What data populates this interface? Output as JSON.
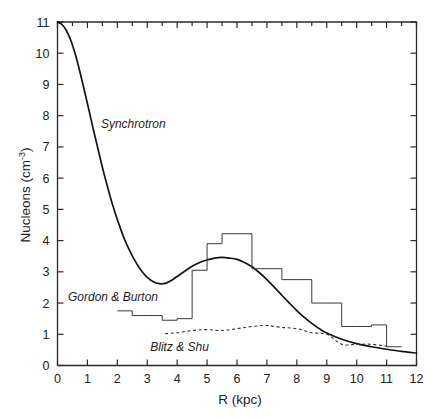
{
  "figure": {
    "background_color": "#ffffff",
    "ink_color": "#1a1a1a"
  },
  "chart_data": {
    "type": "line",
    "title": "",
    "subtitle": "",
    "xlabel": "R (kpc)",
    "ylabel": "Nucleons (cm",
    "ylabel_exponent": "-3",
    "ylabel_close": ")",
    "xlim": [
      0,
      12
    ],
    "ylim": [
      0,
      11
    ],
    "xticks": [
      0,
      1,
      2,
      3,
      4,
      5,
      6,
      7,
      8,
      9,
      10,
      11,
      12
    ],
    "xtick_labels": [
      "0",
      "1",
      "2",
      "3",
      "4",
      "5",
      "6",
      "7",
      "8",
      "9",
      "10",
      "11",
      "12"
    ],
    "yticks": [
      0,
      1,
      2,
      3,
      4,
      5,
      6,
      7,
      8,
      9,
      10,
      11
    ],
    "ytick_labels": [
      "0",
      "1",
      "2",
      "3",
      "4",
      "5",
      "6",
      "7",
      "8",
      "9",
      "10",
      "11"
    ],
    "grid": false,
    "legend": "inline-annotations",
    "frame": "box-with-inward-ticks",
    "annotations": [
      {
        "name": "synchrotron-label",
        "text": "Synchrotron",
        "x": 1.45,
        "y": 7.6,
        "style": "italic"
      },
      {
        "name": "gordon-burton-label",
        "text": "Gordon & Burton",
        "x": 0.35,
        "y": 2.05,
        "style": "italic"
      },
      {
        "name": "blitz-shu-label",
        "text": "Blitz & Shu",
        "x": 3.1,
        "y": 0.45,
        "style": "italic"
      }
    ],
    "series": [
      {
        "name": "Synchrotron",
        "style": "solid",
        "x": [
          0.0,
          0.15,
          0.3,
          0.45,
          0.6,
          0.75,
          0.9,
          1.05,
          1.2,
          1.35,
          1.5,
          1.65,
          1.8,
          1.95,
          2.1,
          2.25,
          2.4,
          2.55,
          2.7,
          2.85,
          3.0,
          3.2,
          3.4,
          3.6,
          3.8,
          4.0,
          4.25,
          4.5,
          4.75,
          5.0,
          5.25,
          5.5,
          5.75,
          6.0,
          6.25,
          6.5,
          6.75,
          7.0,
          7.25,
          7.5,
          7.75,
          8.0,
          8.25,
          8.5,
          8.75,
          9.0,
          9.5,
          10.0,
          10.5,
          11.0,
          11.5,
          12.0
        ],
        "y": [
          11.0,
          10.92,
          10.72,
          10.4,
          9.95,
          9.4,
          8.8,
          8.18,
          7.55,
          6.95,
          6.35,
          5.8,
          5.28,
          4.82,
          4.4,
          4.02,
          3.7,
          3.42,
          3.18,
          2.98,
          2.82,
          2.68,
          2.62,
          2.63,
          2.72,
          2.85,
          3.02,
          3.18,
          3.3,
          3.38,
          3.44,
          3.46,
          3.44,
          3.4,
          3.3,
          3.16,
          2.97,
          2.75,
          2.5,
          2.25,
          2.0,
          1.76,
          1.54,
          1.35,
          1.18,
          1.04,
          0.84,
          0.7,
          0.6,
          0.52,
          0.45,
          0.4
        ]
      },
      {
        "name": "Gordon & Burton",
        "style": "histogram-step",
        "bin_edges": [
          2.0,
          2.5,
          3.0,
          3.5,
          4.0,
          4.5,
          5.0,
          5.5,
          6.0,
          6.5,
          7.0,
          7.5,
          8.0,
          8.5,
          9.0,
          9.5,
          10.0,
          10.5,
          11.0
        ],
        "values": [
          1.75,
          1.6,
          1.6,
          1.45,
          1.5,
          3.05,
          3.9,
          4.22,
          4.22,
          3.1,
          3.1,
          2.75,
          2.75,
          2.0,
          2.0,
          1.25,
          1.25,
          1.3,
          0.6
        ]
      },
      {
        "name": "Blitz & Shu",
        "style": "dotted",
        "x": [
          3.6,
          4.0,
          4.5,
          5.0,
          5.5,
          6.0,
          6.5,
          7.0,
          7.5,
          8.0,
          8.5,
          9.0,
          9.5,
          10.0,
          10.5,
          11.0
        ],
        "y": [
          1.02,
          1.05,
          1.12,
          1.15,
          1.12,
          1.18,
          1.25,
          1.28,
          1.22,
          1.18,
          1.05,
          1.0,
          0.68,
          0.68,
          0.68,
          0.62
        ]
      }
    ]
  }
}
